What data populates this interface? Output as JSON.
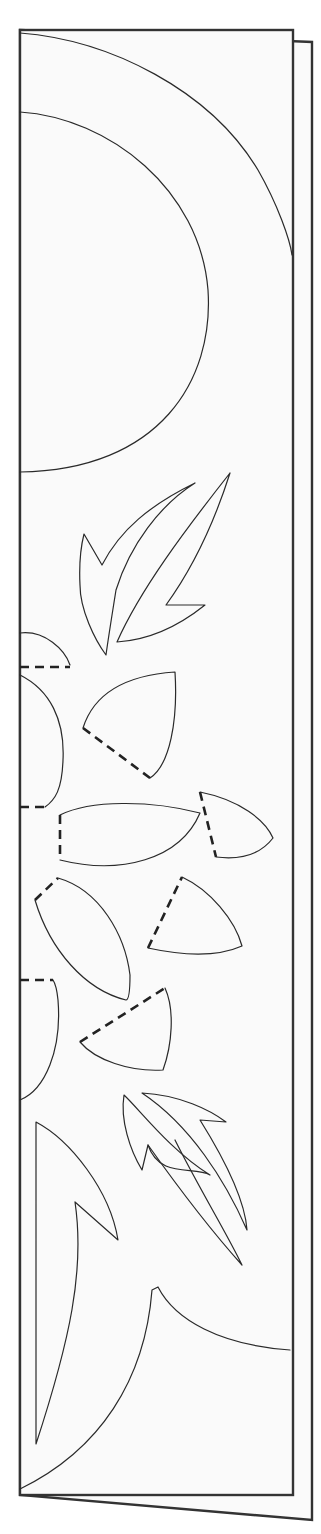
{
  "template": {
    "subject": "folded paper-cut template with sun and leaves",
    "colors": {
      "background": "#ffffff",
      "paper": "#fafafa",
      "line": "#2a2a2a",
      "frame": "#333333"
    },
    "sheets": {
      "back": {
        "x": 0,
        "y": 0,
        "points": "20,30 312,42 312,1520 20,1495"
      },
      "front": {
        "x": 20,
        "y": 30,
        "w": 273,
        "h": 1465
      }
    },
    "elements": [
      {
        "name": "sun-outer-arc",
        "type": "cut",
        "d": "M20,33 C110,40 210,90 258,170 C278,205 290,240 292,255"
      },
      {
        "name": "sun-inner-arc",
        "type": "cut",
        "d": "M20,112 C110,118 200,190 208,290 C214,380 160,470 20,472"
      },
      {
        "name": "leaf-top-left",
        "type": "cut",
        "d": "M84,534 L102,565 C120,530 150,505 195,483 C160,505 130,545 116,590 C112,615 108,640 106,655 C95,640 80,610 80,585 C79,565 80,550 84,534 Z"
      },
      {
        "name": "leaf-top-right",
        "type": "cut",
        "d": "M230,473 C215,520 195,565 166,605 L205,605 C180,625 150,640 117,642 C140,590 185,530 230,473 Z"
      },
      {
        "name": "petal-left-top",
        "type": "cut",
        "d": "M20,633 C45,630 65,650 70,665"
      },
      {
        "name": "petal-left-top-fold",
        "type": "fold",
        "d": "M20,667 L70,667"
      },
      {
        "name": "petal-center-upper",
        "type": "cut",
        "d": "M83,728 C95,690 130,675 175,672 C178,720 170,765 150,778"
      },
      {
        "name": "petal-center-upper-fold",
        "type": "fold",
        "d": "M83,728 L150,778"
      },
      {
        "name": "petal-left-mid",
        "type": "cut",
        "d": "M20,675 C50,690 65,720 63,760 C62,790 55,800 45,807"
      },
      {
        "name": "petal-left-mid-fold",
        "type": "fold",
        "d": "M20,807 L45,807"
      },
      {
        "name": "petal-center-wide",
        "type": "cut",
        "d": "M60,815 C90,800 150,800 200,813 C180,860 120,875 60,860"
      },
      {
        "name": "petal-center-wide-fold",
        "type": "fold",
        "d": "M60,815 L60,860"
      },
      {
        "name": "petal-right-upper",
        "type": "cut",
        "d": "M200,792 C240,800 265,820 273,838 C260,855 240,860 216,857"
      },
      {
        "name": "petal-right-upper-fold",
        "type": "fold",
        "d": "M200,792 L216,857"
      },
      {
        "name": "petal-center-lower",
        "type": "cut",
        "d": "M58,878 C100,890 125,935 130,975 C130,995 128,1000 126,1000 C85,990 50,950 35,900"
      },
      {
        "name": "petal-center-lower-fold",
        "type": "fold",
        "d": "M35,900 L58,878"
      },
      {
        "name": "petal-right-lower",
        "type": "cut",
        "d": "M182,877 C210,890 235,920 242,946 C215,958 180,955 148,948"
      },
      {
        "name": "petal-right-lower-fold",
        "type": "fold",
        "d": "M148,948 L182,877"
      },
      {
        "name": "petal-left-lower",
        "type": "cut",
        "d": "M20,1100 C45,1090 62,1050 58,1000 C57,990 55,983 53,980"
      },
      {
        "name": "petal-left-lower-fold",
        "type": "fold",
        "d": "M20,980 L53,980"
      },
      {
        "name": "petal-center-bottom",
        "type": "cut",
        "d": "M165,988 C175,1010 172,1045 163,1070 C130,1072 95,1060 80,1042"
      },
      {
        "name": "petal-center-bottom-fold",
        "type": "fold",
        "d": "M80,1042 L165,988"
      },
      {
        "name": "leaf-bottom-left",
        "type": "cut",
        "d": "M124,1095 C140,1110 170,1150 210,1175 C195,1165 160,1180 148,1145 L142,1170 C130,1150 120,1120 124,1095 Z"
      },
      {
        "name": "leaf-bottom-right",
        "type": "cut",
        "d": "M142,1093 C180,1095 210,1110 226,1122 L200,1120 C225,1160 245,1200 247,1230 C225,1180 190,1125 142,1093 Z"
      },
      {
        "name": "leaf-bottom-long",
        "type": "cut",
        "d": "M148,1145 C180,1190 215,1235 242,1265 C225,1230 200,1190 175,1140"
      },
      {
        "name": "big-leaf-bottom",
        "type": "cut",
        "d": "M36,1122 C70,1140 110,1190 118,1240 L75,1202 C85,1270 70,1340 36,1444 Z"
      },
      {
        "name": "big-sweep-bottom",
        "type": "cut",
        "d": "M20,1489 C100,1450 145,1380 152,1290 L158,1287 C175,1320 220,1345 290,1350"
      }
    ]
  }
}
